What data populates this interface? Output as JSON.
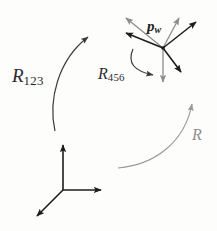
{
  "figure": {
    "type": "vector-diagram",
    "background_color": "#fdfdfc"
  },
  "colors": {
    "black": "#1c1c1c",
    "gray": "#8d8d8d",
    "curve_dark": "#3a3a3a",
    "curve_gray": "#9a9a9a",
    "label_text": "#2b2b2b"
  },
  "labels": {
    "r123": {
      "base": "R",
      "sub": "123"
    },
    "r456": {
      "base": "R",
      "sub": "456"
    },
    "r": {
      "base": "R",
      "sub": ""
    },
    "pw": {
      "base": "p",
      "sub": "w"
    }
  },
  "frame": {
    "name": "world-coordinate-frame",
    "origin": [
      63,
      190
    ],
    "axes": [
      {
        "name": "axis-up",
        "tip": [
          63,
          141
        ],
        "color": "#1c1c1c"
      },
      {
        "name": "axis-right",
        "tip": [
          105,
          190
        ],
        "color": "#1c1c1c"
      },
      {
        "name": "axis-down-left",
        "tip": [
          33,
          219
        ],
        "color": "#1c1c1c"
      }
    ]
  },
  "vector_bundle": {
    "name": "point-pw-vectors",
    "origin": [
      163,
      48
    ],
    "arrows": [
      {
        "name": "arrow-upper-left-gray",
        "tip": [
          122,
          15
        ],
        "color": "#8d8d8d"
      },
      {
        "name": "arrow-left-black",
        "tip": [
          122,
          31
        ],
        "color": "#1c1c1c"
      },
      {
        "name": "arrow-upper-right-gray",
        "tip": [
          182,
          15
        ],
        "color": "#8d8d8d"
      },
      {
        "name": "arrow-upper-right-black",
        "tip": [
          200,
          19
        ],
        "color": "#1c1c1c"
      },
      {
        "name": "arrow-down-gray",
        "tip": [
          163,
          86
        ],
        "color": "#8d8d8d"
      },
      {
        "name": "arrow-down-right-black",
        "tip": [
          184,
          76
        ],
        "color": "#1c1c1c"
      }
    ]
  },
  "curves": [
    {
      "name": "curve-r123",
      "color": "#3a3a3a",
      "path": "M 55 131 C 48 100, 58 60, 90 35",
      "arrow_tip": [
        92,
        33
      ],
      "arrow_angle": -38
    },
    {
      "name": "curve-r456",
      "color": "#3a3a3a",
      "path": "M 133 49 C 128 62, 134 71, 155 75",
      "arrow_tip": [
        158,
        76
      ],
      "arrow_angle": 14
    },
    {
      "name": "curve-r",
      "color": "#9a9a9a",
      "path": "M 118 168 C 152 165, 184 143, 192 101",
      "arrow_tip": [
        193,
        98
      ],
      "arrow_angle": -78
    }
  ]
}
